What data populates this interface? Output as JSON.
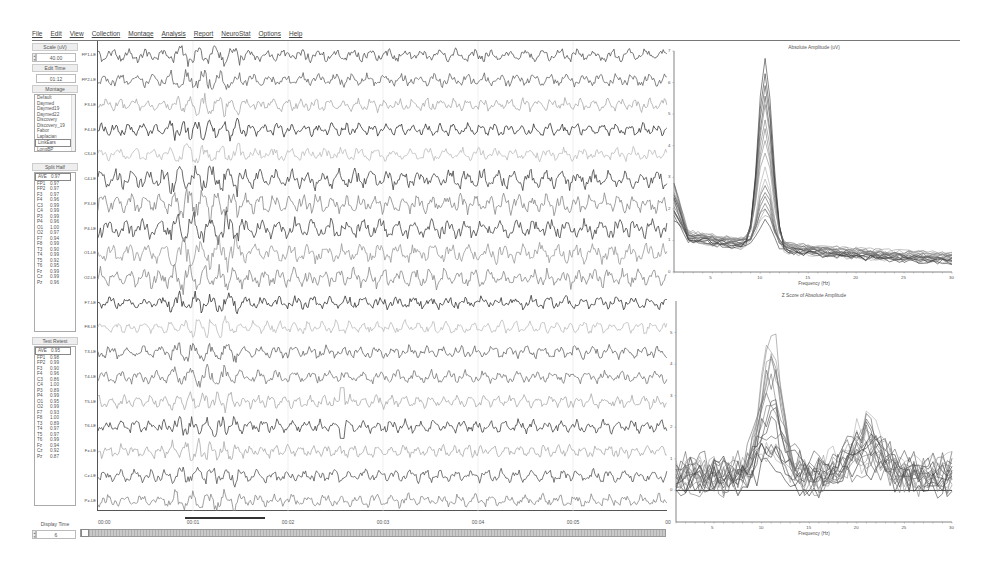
{
  "menu": [
    "File",
    "Edit",
    "View",
    "Collection",
    "Montage",
    "Analysis",
    "Report",
    "NeuroStat",
    "Options",
    "Help"
  ],
  "left_panel": {
    "scale_label": "Scale (uV)",
    "scale_value": "40.00",
    "edit_time_label": "Edit Time",
    "edit_time_value": "01:12",
    "montage_label": "Montage",
    "montage_items": [
      "Default",
      "Daymed",
      "Daymed19",
      "Daymed22",
      "Discovery",
      "Discovery_19",
      "Fabor",
      "Laplacian",
      "LinkEars",
      "LongBP"
    ],
    "montage_selected": "LinkEars",
    "split_half_label": "Split Half",
    "split_half": [
      {
        "ch": "AVE",
        "v": "0.97"
      },
      {
        "ch": "FP1",
        "v": "0.97"
      },
      {
        "ch": "FP2",
        "v": "0.97"
      },
      {
        "ch": "F3",
        "v": "0.97"
      },
      {
        "ch": "F4",
        "v": "0.96"
      },
      {
        "ch": "C3",
        "v": "0.99"
      },
      {
        "ch": "C4",
        "v": "0.99"
      },
      {
        "ch": "P3",
        "v": "0.99"
      },
      {
        "ch": "P4",
        "v": "0.96"
      },
      {
        "ch": "O1",
        "v": "1.00"
      },
      {
        "ch": "O2",
        "v": "0.97"
      },
      {
        "ch": "F7",
        "v": "0.94"
      },
      {
        "ch": "F8",
        "v": "0.99"
      },
      {
        "ch": "T3",
        "v": "0.90"
      },
      {
        "ch": "T4",
        "v": "0.99"
      },
      {
        "ch": "T5",
        "v": "0.92"
      },
      {
        "ch": "T6",
        "v": "0.95"
      },
      {
        "ch": "Fz",
        "v": "0.99"
      },
      {
        "ch": "Cz",
        "v": "0.99"
      },
      {
        "ch": "Pz",
        "v": "0.96"
      }
    ],
    "test_retest_label": "Test Retest",
    "test_retest": [
      {
        "ch": "AVE",
        "v": "0.95"
      },
      {
        "ch": "FP1",
        "v": "0.98"
      },
      {
        "ch": "FP2",
        "v": "0.99"
      },
      {
        "ch": "F3",
        "v": "0.90"
      },
      {
        "ch": "F4",
        "v": "0.96"
      },
      {
        "ch": "C3",
        "v": "0.86"
      },
      {
        "ch": "C4",
        "v": "1.00"
      },
      {
        "ch": "P3",
        "v": "0.89"
      },
      {
        "ch": "P4",
        "v": "0.99"
      },
      {
        "ch": "O1",
        "v": "0.95"
      },
      {
        "ch": "O2",
        "v": "0.99"
      },
      {
        "ch": "F7",
        "v": "0.93"
      },
      {
        "ch": "F8",
        "v": "1.00"
      },
      {
        "ch": "T3",
        "v": "0.89"
      },
      {
        "ch": "T4",
        "v": "0.97"
      },
      {
        "ch": "T5",
        "v": "0.97"
      },
      {
        "ch": "T6",
        "v": "0.99"
      },
      {
        "ch": "Fz",
        "v": "0.94"
      },
      {
        "ch": "Cz",
        "v": "0.92"
      },
      {
        "ch": "Pz",
        "v": "0.87"
      }
    ],
    "display_time_label": "Display Time",
    "display_time_value": "6"
  },
  "eeg": {
    "channels": [
      "FP1-LE",
      "FP2-LE",
      "F3-LE",
      "F4-LE",
      "C3-LE",
      "C4-LE",
      "P3-LE",
      "P4-LE",
      "O1-LE",
      "O2-LE",
      "F7-LE",
      "F8-LE",
      "T3-LE",
      "T4-LE",
      "T5-LE",
      "T6-LE",
      "Fz-LE",
      "Cz-LE",
      "Pz-LE"
    ],
    "channel_gray": [
      "#555",
      "#666",
      "#aaa",
      "#333",
      "#bbb",
      "#444",
      "#888",
      "#444",
      "#999",
      "#888",
      "#333",
      "#bbb",
      "#666",
      "#777",
      "#aaa",
      "#444",
      "#aaa",
      "#555",
      "#888"
    ],
    "time_labels": [
      "00:00",
      "00:01",
      "00:02",
      "00:03",
      "00:04",
      "00:05",
      "00"
    ],
    "selection": {
      "start_sec": 1.0,
      "end_sec": 1.8
    }
  },
  "chart_data": [
    {
      "type": "line",
      "title": "Absolute Amplitude (uV)",
      "xlabel": "Frequency (Hz)",
      "ylabel": "",
      "xlim": [
        1,
        30
      ],
      "ylim": [
        0,
        7
      ],
      "xticks": [
        5,
        10,
        15,
        20,
        25,
        30
      ],
      "yticks": [
        0,
        1,
        2,
        3,
        4,
        5,
        6,
        7
      ],
      "series_count": 19,
      "x": [
        1,
        2,
        3,
        4,
        5,
        6,
        7,
        8,
        9,
        10,
        11,
        12,
        13,
        14,
        15,
        16,
        17,
        18,
        19,
        20,
        21,
        22,
        23,
        24,
        25,
        26,
        27,
        28,
        29,
        30
      ],
      "envelope": {
        "peak_hz": 10.5,
        "peak_max": 6.9,
        "peak_min": 1.7,
        "typical_peak": 3.5,
        "low_freq_level": 1.2,
        "tail_level_30hz": 0.4
      }
    },
    {
      "type": "line",
      "title": "Z Score of Absolute Amplitude",
      "xlabel": "Frequency (Hz)",
      "ylabel": "",
      "xlim": [
        1,
        30
      ],
      "ylim": [
        -1,
        6
      ],
      "xticks": [
        5,
        10,
        15,
        20,
        25,
        30
      ],
      "yticks": [
        0,
        1,
        2,
        3,
        4,
        5
      ],
      "reference_line": 0,
      "series_count": 19,
      "x": [
        1,
        2,
        3,
        4,
        5,
        6,
        7,
        8,
        9,
        10,
        11,
        12,
        13,
        14,
        15,
        16,
        17,
        18,
        19,
        20,
        21,
        22,
        23,
        24,
        25,
        26,
        27,
        28,
        29,
        30
      ],
      "envelope": {
        "peak_hz": 10.5,
        "peak_max": 5.0,
        "typical_peak": 3.0,
        "secondary_peak_hz": 21,
        "secondary_peak_max": 3.4,
        "low_freq_level": 0.5,
        "tail_level_30hz": 0.5
      }
    }
  ]
}
